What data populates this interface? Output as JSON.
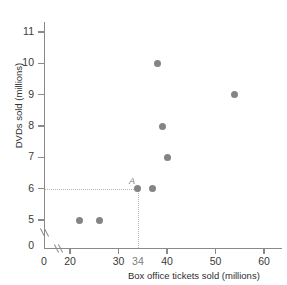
{
  "chart_data": {
    "type": "scatter",
    "title": "",
    "xlabel": "Box office tickets sold (millions)",
    "ylabel": "DVDs sold (millions)",
    "xlim": [
      16,
      62
    ],
    "ylim": [
      4.4,
      11.6
    ],
    "grid": false,
    "legend": null,
    "x_ticks": [
      {
        "value": 0,
        "label": "0"
      },
      {
        "value": 20,
        "label": "20"
      },
      {
        "value": 30,
        "label": "30"
      },
      {
        "value": 34,
        "label": "34"
      },
      {
        "value": 40,
        "label": "40"
      },
      {
        "value": 50,
        "label": "50"
      },
      {
        "value": 60,
        "label": "60"
      }
    ],
    "y_ticks": [
      {
        "value": 0,
        "label": "0"
      },
      {
        "value": 5,
        "label": "5"
      },
      {
        "value": 6,
        "label": "6"
      },
      {
        "value": 7,
        "label": "7"
      },
      {
        "value": 8,
        "label": "8"
      },
      {
        "value": 9,
        "label": "9"
      },
      {
        "value": 10,
        "label": "10"
      },
      {
        "value": 11,
        "label": "11"
      }
    ],
    "axis_break_x": true,
    "axis_break_y": true,
    "points": [
      {
        "x": 22,
        "y": 5,
        "label": ""
      },
      {
        "x": 26,
        "y": 5,
        "label": ""
      },
      {
        "x": 34,
        "y": 6,
        "label": "A"
      },
      {
        "x": 37,
        "y": 6,
        "label": ""
      },
      {
        "x": 40,
        "y": 7,
        "label": ""
      },
      {
        "x": 39,
        "y": 8,
        "label": ""
      },
      {
        "x": 54,
        "y": 9,
        "label": ""
      },
      {
        "x": 38,
        "y": 10,
        "label": ""
      }
    ],
    "annotations": [
      {
        "name": "point-a-guides",
        "from_axis_y": 6,
        "to_x": 34,
        "style": "dotted",
        "color": "#b4b4b4"
      }
    ],
    "colors": {
      "point": "#848484",
      "axis": "#8a8a8a",
      "guide": "#b4b4b4",
      "text": "#2e2e2e",
      "annotation_text": "#7a7a7a",
      "background": "#ffffff"
    }
  }
}
